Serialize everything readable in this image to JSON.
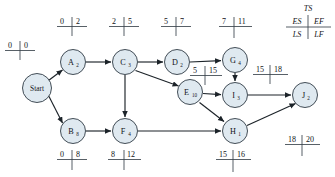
{
  "diagram": {
    "type": "activity-on-node-network",
    "legend": {
      "total_slack": "TS",
      "early_start": "ES",
      "early_finish": "EF",
      "late_start": "LS",
      "late_finish": "LF"
    },
    "separator": "|",
    "nodes": [
      {
        "id": "start",
        "label": "Start",
        "duration": "",
        "cx": 37,
        "cy": 88,
        "r": 14.5
      },
      {
        "id": "a",
        "label": "A",
        "duration": "2",
        "cx": 73,
        "cy": 62,
        "r": 12.5
      },
      {
        "id": "b",
        "label": "B",
        "duration": "8",
        "cx": 73,
        "cy": 131,
        "r": 12.5
      },
      {
        "id": "c",
        "label": "C",
        "duration": "3",
        "cx": 125,
        "cy": 62,
        "r": 12.5
      },
      {
        "id": "d",
        "label": "D",
        "duration": "2",
        "cx": 177,
        "cy": 62,
        "r": 12.5
      },
      {
        "id": "e",
        "label": "E",
        "duration": "10",
        "cx": 190,
        "cy": 92,
        "r": 12.5
      },
      {
        "id": "f",
        "label": "F",
        "duration": "4",
        "cx": 125,
        "cy": 131,
        "r": 12.5
      },
      {
        "id": "g",
        "label": "G",
        "duration": "4",
        "cx": 235,
        "cy": 60,
        "r": 12.5
      },
      {
        "id": "h",
        "label": "H",
        "duration": "1",
        "cx": 235,
        "cy": 131,
        "r": 12.5
      },
      {
        "id": "i",
        "label": "I",
        "duration": "3",
        "cx": 235,
        "cy": 95,
        "r": 12.5
      },
      {
        "id": "j",
        "label": "J",
        "duration": "2",
        "cx": 305,
        "cy": 95,
        "r": 12.5
      }
    ],
    "time_labels": [
      {
        "for": "start",
        "es": "0",
        "ef": "0",
        "x": 22,
        "y": 50
      },
      {
        "for": "a",
        "es": "0",
        "ef": "2",
        "x": 73,
        "y": 26
      },
      {
        "for": "c",
        "es": "2",
        "ef": "5",
        "x": 125,
        "y": 26
      },
      {
        "for": "d",
        "es": "5",
        "ef": "7",
        "x": 177,
        "y": 26
      },
      {
        "for": "g",
        "es": "7",
        "ef": "11",
        "x": 235,
        "y": 26
      },
      {
        "for": "e",
        "es": "5",
        "ef": "15",
        "x": 206,
        "y": 75
      },
      {
        "for": "i",
        "es": "15",
        "ef": "18",
        "x": 272,
        "y": 74
      },
      {
        "for": "b",
        "es": "0",
        "ef": "8",
        "x": 73,
        "y": 157
      },
      {
        "for": "f",
        "es": "8",
        "ef": "12",
        "x": 125,
        "y": 157
      },
      {
        "for": "h",
        "es": "15",
        "ef": "16",
        "x": 235,
        "y": 157
      },
      {
        "for": "j",
        "es": "18",
        "ef": "20",
        "x": 305,
        "y": 144
      }
    ],
    "edges": [
      {
        "from": "start",
        "to": "a"
      },
      {
        "from": "start",
        "to": "b"
      },
      {
        "from": "a",
        "to": "c"
      },
      {
        "from": "c",
        "to": "d"
      },
      {
        "from": "c",
        "to": "e"
      },
      {
        "from": "c",
        "to": "f"
      },
      {
        "from": "d",
        "to": "g"
      },
      {
        "from": "g",
        "to": "i"
      },
      {
        "from": "e",
        "to": "i"
      },
      {
        "from": "e",
        "to": "h"
      },
      {
        "from": "b",
        "to": "f"
      },
      {
        "from": "f",
        "to": "h"
      },
      {
        "from": "i",
        "to": "j"
      },
      {
        "from": "h",
        "to": "j"
      }
    ]
  }
}
